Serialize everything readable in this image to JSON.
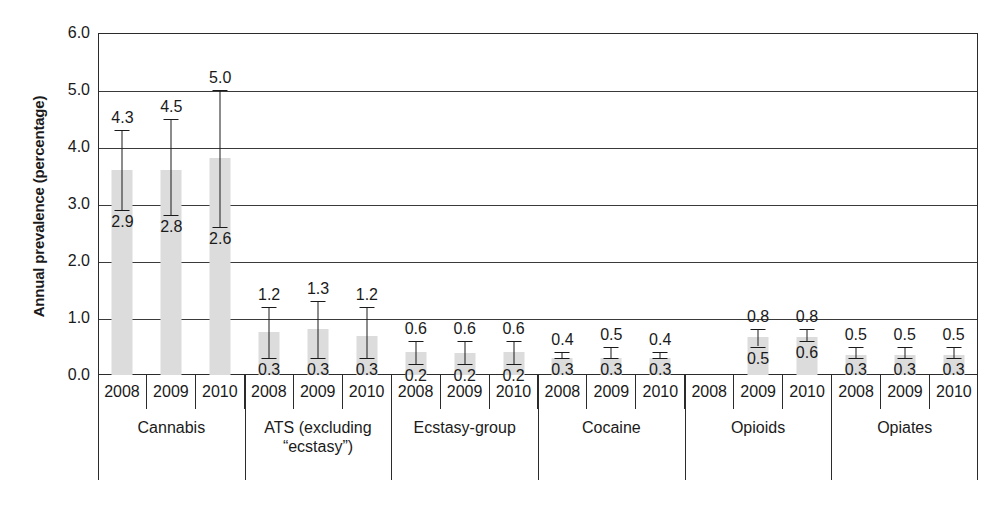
{
  "chart_data": {
    "type": "bar",
    "title": "",
    "xlabel": "",
    "ylabel": "Annual prevalence (percentage)",
    "ylim": [
      0.0,
      6.0
    ],
    "ytick_labels": [
      "6.0",
      "5.0",
      "4.0",
      "3.0",
      "2.0",
      "1.0",
      "0.0"
    ],
    "ytick_values": [
      6.0,
      5.0,
      4.0,
      3.0,
      2.0,
      1.0,
      0.0
    ],
    "grid": true,
    "legend": "none",
    "bar_color": "#dcdcdc",
    "error_bar_color": "#1a1a1a",
    "axis_color": "#2b2b2b",
    "categories": [
      "2008",
      "2009",
      "2010"
    ],
    "groups": [
      {
        "name": "Cannabis",
        "label_lines": [
          "Cannabis"
        ],
        "bars": [
          {
            "year": "2008",
            "value": 3.6,
            "low": 2.9,
            "high": 4.3,
            "low_label": "2.9",
            "high_label": "4.3"
          },
          {
            "year": "2009",
            "value": 3.6,
            "low": 2.8,
            "high": 4.5,
            "low_label": "2.8",
            "high_label": "4.5"
          },
          {
            "year": "2010",
            "value": 3.8,
            "low": 2.6,
            "high": 5.0,
            "low_label": "2.6",
            "high_label": "5.0"
          }
        ]
      },
      {
        "name": "ATS (excluding “ecstasy”)",
        "label_lines": [
          "ATS (excluding",
          "“ecstasy”)"
        ],
        "bars": [
          {
            "year": "2008",
            "value": 0.75,
            "low": 0.3,
            "high": 1.2,
            "low_label": "0.3",
            "high_label": "1.2"
          },
          {
            "year": "2009",
            "value": 0.8,
            "low": 0.3,
            "high": 1.3,
            "low_label": "0.3",
            "high_label": "1.3"
          },
          {
            "year": "2010",
            "value": 0.68,
            "low": 0.3,
            "high": 1.2,
            "low_label": "0.3",
            "high_label": "1.2"
          }
        ]
      },
      {
        "name": "Ecstasy-group",
        "label_lines": [
          "Ecstasy-group"
        ],
        "bars": [
          {
            "year": "2008",
            "value": 0.4,
            "low": 0.2,
            "high": 0.6,
            "low_label": "0.2",
            "high_label": "0.6"
          },
          {
            "year": "2009",
            "value": 0.38,
            "low": 0.2,
            "high": 0.6,
            "low_label": "0.2",
            "high_label": "0.6"
          },
          {
            "year": "2010",
            "value": 0.4,
            "low": 0.2,
            "high": 0.6,
            "low_label": "0.2",
            "high_label": "0.6"
          }
        ]
      },
      {
        "name": "Cocaine",
        "label_lines": [
          "Cocaine"
        ],
        "bars": [
          {
            "year": "2008",
            "value": 0.3,
            "low": 0.3,
            "high": 0.4,
            "low_label": "0.3",
            "high_label": "0.4"
          },
          {
            "year": "2009",
            "value": 0.3,
            "low": 0.3,
            "high": 0.5,
            "low_label": "0.3",
            "high_label": "0.5"
          },
          {
            "year": "2010",
            "value": 0.3,
            "low": 0.3,
            "high": 0.4,
            "low_label": "0.3",
            "high_label": "0.4"
          }
        ]
      },
      {
        "name": "Opioids",
        "label_lines": [
          "Opioids"
        ],
        "bars": [
          {
            "year": "2008",
            "value": null,
            "low": null,
            "high": null,
            "low_label": "",
            "high_label": ""
          },
          {
            "year": "2009",
            "value": 0.67,
            "low": 0.5,
            "high": 0.8,
            "low_label": "0.5",
            "high_label": "0.8"
          },
          {
            "year": "2010",
            "value": 0.67,
            "low": 0.6,
            "high": 0.8,
            "low_label": "0.6",
            "high_label": "0.8"
          }
        ]
      },
      {
        "name": "Opiates",
        "label_lines": [
          "Opiates"
        ],
        "bars": [
          {
            "year": "2008",
            "value": 0.35,
            "low": 0.3,
            "high": 0.5,
            "low_label": "0.3",
            "high_label": "0.5"
          },
          {
            "year": "2009",
            "value": 0.35,
            "low": 0.3,
            "high": 0.5,
            "low_label": "0.3",
            "high_label": "0.5"
          },
          {
            "year": "2010",
            "value": 0.35,
            "low": 0.3,
            "high": 0.5,
            "low_label": "0.3",
            "high_label": "0.5"
          }
        ]
      }
    ]
  }
}
